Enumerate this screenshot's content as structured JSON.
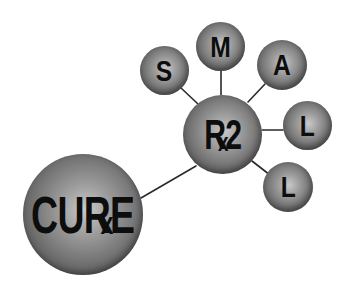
{
  "logo": {
    "main_node": {
      "text_before": "CU",
      "r_letter": "R",
      "x_letter": "x",
      "text_after": "E",
      "full_text": "CURxE"
    },
    "hub_node": {
      "r_letter": "R",
      "x_letter": "x",
      "text_after": "2",
      "full_text": "Rx2"
    },
    "satellite_nodes": [
      {
        "letter": "S"
      },
      {
        "letter": "M"
      },
      {
        "letter": "A"
      },
      {
        "letter": "L"
      },
      {
        "letter": "L"
      }
    ],
    "colors": {
      "background": "#ffffff",
      "sphere_light": "#c9c9c9",
      "sphere_dark": "#3a3a3a",
      "text": "#0d0d0d",
      "connector": "#2a2a2a"
    }
  }
}
